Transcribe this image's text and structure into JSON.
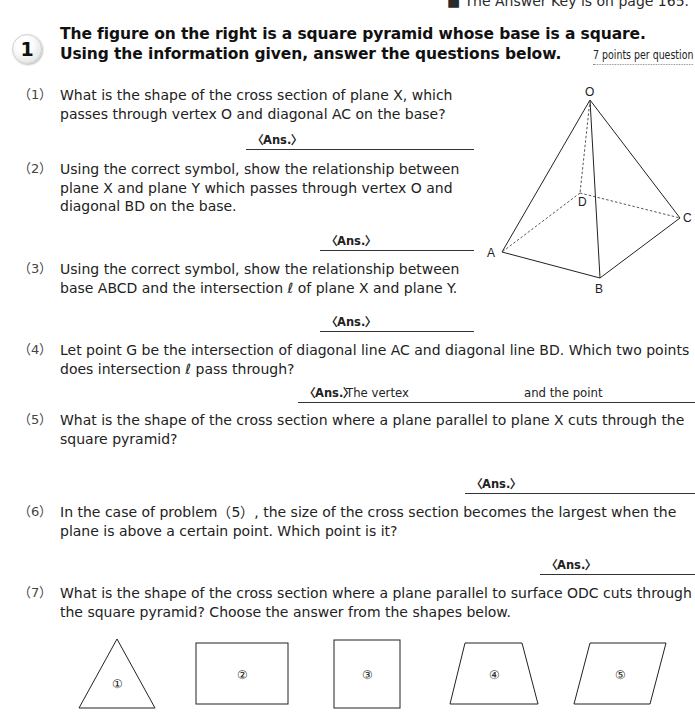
{
  "header": {
    "note": "■ The Answer Key is on page 165."
  },
  "section": {
    "number": "1",
    "title_line1": "The figure on the right is a square pyramid whose base is a square.",
    "title_line2": "Using the information given, answer the questions below.",
    "points": "7 points per question"
  },
  "answer_label": "〈Ans.〉",
  "questions": [
    {
      "num": "（1）",
      "text": "What is the shape of the cross section of plane X, which passes through vertex O and diagonal AC on the base?"
    },
    {
      "num": "（2）",
      "text": "Using the correct symbol, show the relationship between plane X and plane Y which passes through vertex O and diagonal BD on the base."
    },
    {
      "num": "（3）",
      "text": "Using the correct symbol, show the relationship between base ABCD and the intersection ℓ of plane X and plane Y."
    },
    {
      "num": "（4）",
      "text": "Let point G be the intersection of diagonal line AC and diagonal line BD. Which two points does intersection ℓ pass through?",
      "ans_part1": "The vertex",
      "ans_part2": "and the point"
    },
    {
      "num": "（5）",
      "text": "What is the shape of the cross section where a plane parallel to plane X cuts through the square pyramid?"
    },
    {
      "num": "（6）",
      "text": "In the case of problem（5）, the size of the cross section becomes the largest when the plane is above a certain point. Which point is it?"
    },
    {
      "num": "（7）",
      "text": "What is the shape of the cross section where a plane parallel to surface ODC cuts through the square pyramid? Choose the answer from the shapes below."
    }
  ],
  "figure": {
    "vertices": {
      "O": "O",
      "A": "A",
      "B": "B",
      "C": "C",
      "D": "D"
    }
  },
  "choices": [
    {
      "label": "①",
      "shape": "triangle"
    },
    {
      "label": "②",
      "shape": "rectangle"
    },
    {
      "label": "③",
      "shape": "square"
    },
    {
      "label": "④",
      "shape": "trapezoid"
    },
    {
      "label": "⑤",
      "shape": "parallelogram"
    }
  ]
}
